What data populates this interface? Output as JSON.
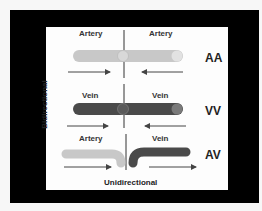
{
  "figure": {
    "rows": [
      {
        "code": "AA",
        "left_label": "Artery",
        "right_label": "Artery"
      },
      {
        "code": "VV",
        "left_label": "Vein",
        "right_label": "Vein"
      },
      {
        "code": "AV",
        "left_label": "Artery",
        "right_label": "Vein"
      }
    ],
    "y_axis_label": "Bidirectional",
    "x_axis_label": "Unidirectional",
    "colors": {
      "frame": "#000000",
      "panel": "#fdfdfd",
      "artery": "#c8c8c8",
      "artery_cap": "#e2e2e2",
      "vein": "#4a4a4a",
      "vein_cap": "#7a7a7a",
      "arrow": "#444444",
      "divider": "#333333"
    }
  }
}
